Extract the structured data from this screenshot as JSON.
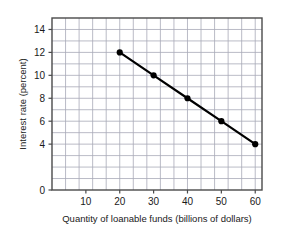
{
  "chart_data": {
    "type": "line",
    "title": "",
    "subtitle": "",
    "xlabel": "Quantity of loanable funds (billions of dollars)",
    "ylabel": "Interest rate (percent)",
    "x": [
      20,
      30,
      40,
      50,
      60
    ],
    "values": [
      12,
      10,
      8,
      6,
      4
    ],
    "series": [
      {
        "name": "Demand for loanable funds",
        "x": [
          20,
          30,
          40,
          50,
          60
        ],
        "values": [
          12,
          10,
          8,
          6,
          4
        ]
      }
    ],
    "points": [
      {
        "x": 20,
        "y": 12
      },
      {
        "x": 30,
        "y": 10
      },
      {
        "x": 40,
        "y": 8
      },
      {
        "x": 50,
        "y": 6
      },
      {
        "x": 60,
        "y": 4
      }
    ],
    "xlim": [
      0,
      62
    ],
    "ylim": [
      0,
      15
    ],
    "xticks": [
      10,
      20,
      30,
      40,
      50,
      60
    ],
    "xtick_labels": [
      "10",
      "20",
      "30",
      "40",
      "50",
      "60"
    ],
    "yticks": [
      0,
      4,
      6,
      8,
      10,
      12,
      14
    ],
    "ytick_labels": [
      "0",
      "4",
      "6",
      "8",
      "10",
      "12",
      "14"
    ],
    "x_gridline_step": 4,
    "y_gridline_step": 1,
    "grid": true,
    "legend": false,
    "legend_position": "none",
    "line_color": "#000000",
    "marker_color": "#000000",
    "grid_color": "#a8aab8",
    "axis_color": "#4a4a4a",
    "background_color": "#ffffff"
  }
}
